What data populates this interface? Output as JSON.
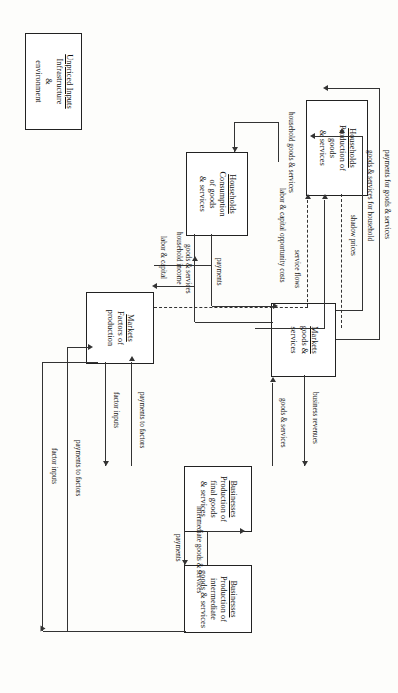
{
  "diagram": {
    "type": "flow-diagram",
    "orientation": "landscape artwork rendered rotated 90 degrees in a portrait frame",
    "stroke_color": "#333333",
    "box_fill": "#ffffff",
    "background": "#fdfdfb"
  },
  "nodes": [
    {
      "id": "households-production",
      "heading": "Households",
      "lines": [
        "Production of",
        "goods",
        "& services"
      ]
    },
    {
      "id": "households-consumption",
      "heading": "Households",
      "lines": [
        "Consumption",
        "of goods",
        "& services"
      ]
    },
    {
      "id": "unpriced-inputs",
      "heading": "Unpriced Inputs",
      "lines": [
        "Infrastructure",
        "&",
        "environment"
      ]
    },
    {
      "id": "markets-goods-services",
      "heading": "Markets",
      "lines": [
        "goods &",
        "services"
      ]
    },
    {
      "id": "markets-factors",
      "heading": "Markets",
      "lines": [
        "Factors of",
        "production"
      ]
    },
    {
      "id": "businesses-final",
      "heading": "Businesses",
      "lines": [
        "Production of",
        "final goods",
        "& services"
      ]
    },
    {
      "id": "businesses-intermediate",
      "heading": "Businesses",
      "lines": [
        "Production of",
        "intermediate",
        "goods & services"
      ]
    }
  ],
  "edge_labels": {
    "shadow_prices": "shadow prices",
    "service_flows": "service flows",
    "labor_capital_opportunity_costs": "labor & capital opportunity costs",
    "household_goods_services": "household goods & services",
    "payments_for_goods_services": "payments for goods & services",
    "goods_services_for_household": "goods & services for household",
    "payments": "payments",
    "goods_services": "goods & services",
    "household_income": "household income",
    "labor_capital": "labor & capital",
    "business_revenues": "business revenues",
    "goods_services_2": "goods & services",
    "payments_to_factors": "payments to factors",
    "factor_inputs": "factor inputs",
    "intermediate_goods_services": "intermediate goods & services",
    "payments_2": "payments",
    "payments_to_factors_2": "payments to factors",
    "factor_inputs_2": "factor inputs"
  }
}
